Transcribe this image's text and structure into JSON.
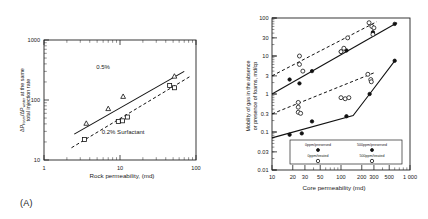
{
  "figure": {
    "panel_a_caption": "(A)",
    "panel_b_caption": "(B)"
  },
  "chart_data": [
    {
      "id": "panel_a",
      "type": "scatter",
      "title": "",
      "xlabel": "Rock permeability, (md)",
      "ylabel": "ΔP_foam/ΔP_water at the same total injection rate",
      "ylabel_line1": "ΔP",
      "ylabel_sub1": "foam",
      "ylabel_mid": "/ΔP",
      "ylabel_sub2": "water",
      "ylabel_tail": " at the same",
      "ylabel_line2": "total injection rate",
      "xscale": "log",
      "yscale": "log",
      "xlim": [
        1,
        100
      ],
      "ylim": [
        10,
        1000
      ],
      "xticks": [
        "1",
        "10",
        "100"
      ],
      "yticks": [
        "10",
        "100",
        "1000"
      ],
      "grid": false,
      "annotations": [
        {
          "text": "0.5%",
          "x": 6.0,
          "y": 330
        },
        {
          "text": "0.2% Surfactant",
          "x": 11.0,
          "y": 27
        }
      ],
      "series": [
        {
          "name": "0.5%",
          "marker": "triangle-open",
          "line": "solid",
          "points": [
            {
              "x": 3.6,
              "y": 41
            },
            {
              "x": 7.0,
              "y": 72
            },
            {
              "x": 11.0,
              "y": 115
            },
            {
              "x": 52.0,
              "y": 250
            }
          ],
          "fit_line": [
            {
              "x": 2.5,
              "y": 27
            },
            {
              "x": 70.0,
              "y": 300
            }
          ]
        },
        {
          "name": "0.2% Surfactant",
          "marker": "square-open",
          "line": "dashed",
          "points": [
            {
              "x": 3.4,
              "y": 22
            },
            {
              "x": 9.5,
              "y": 44
            },
            {
              "x": 12.5,
              "y": 52
            },
            {
              "x": 10.8,
              "y": 45
            },
            {
              "x": 45.0,
              "y": 175
            },
            {
              "x": 52.0,
              "y": 160
            }
          ],
          "fit_line": [
            {
              "x": 2.3,
              "y": 16
            },
            {
              "x": 85.0,
              "y": 250
            }
          ]
        }
      ]
    },
    {
      "id": "panel_b",
      "type": "scatter",
      "title": "",
      "xlabel": "Core permeability (md)",
      "ylabel": "Mobility of gas in the absence or presence of foams, md/cp",
      "ylabel_line1": "Mobility of gas in the absence",
      "ylabel_line2": "or presence of foams, md/cp",
      "xscale": "log",
      "yscale": "log",
      "xlim": [
        10,
        1000
      ],
      "ylim": [
        0.01,
        100
      ],
      "xticks": [
        "10",
        "20",
        "30",
        "50",
        "100",
        "200",
        "300",
        "500",
        "1 000"
      ],
      "yticks": [
        "100",
        "30",
        "10",
        "3",
        "1",
        "0.3",
        "0.1",
        "0.03",
        "0.01"
      ],
      "grid": false,
      "legend": {
        "position": "bottom-left-inside",
        "entries": [
          {
            "label": "0ppm/preserved",
            "marker": "circle-filled"
          },
          {
            "label": "500ppm/preserved",
            "marker": "circle-filled"
          },
          {
            "label": "0ppm/treated",
            "marker": "circle-open"
          },
          {
            "label": "500ppm/treated",
            "marker": "circle-open"
          }
        ]
      },
      "series": [
        {
          "name": "0ppm/preserved",
          "marker": "circle-filled",
          "line": "solid",
          "points": [
            {
              "x": 18,
              "y": 2.4
            },
            {
              "x": 25,
              "y": 1.9
            },
            {
              "x": 38,
              "y": 4.0
            },
            {
              "x": 100,
              "y": 13.0
            },
            {
              "x": 120,
              "y": 14.0
            },
            {
              "x": 290,
              "y": 42.0
            },
            {
              "x": 600,
              "y": 70.0
            }
          ],
          "fit_line": [
            {
              "x": 10,
              "y": 1.0
            },
            {
              "x": 650,
              "y": 75
            }
          ]
        },
        {
          "name": "0ppm/treated",
          "marker": "circle-open",
          "line": "dashed",
          "points": [
            {
              "x": 25,
              "y": 10.0
            },
            {
              "x": 25,
              "y": 6.0
            },
            {
              "x": 28,
              "y": 4.0
            },
            {
              "x": 100,
              "y": 13.0
            },
            {
              "x": 110,
              "y": 16.0
            },
            {
              "x": 125,
              "y": 30.0
            },
            {
              "x": 255,
              "y": 75.0
            },
            {
              "x": 280,
              "y": 60.0
            },
            {
              "x": 300,
              "y": 55.0
            },
            {
              "x": 290,
              "y": 37.0
            }
          ],
          "fit_line": [
            {
              "x": 10,
              "y": 3.0
            },
            {
              "x": 330,
              "y": 80
            }
          ]
        },
        {
          "name": "500ppm/preserved",
          "marker": "circle-filled",
          "line": "solid",
          "points": [
            {
              "x": 18,
              "y": 0.085
            },
            {
              "x": 27,
              "y": 0.092
            },
            {
              "x": 38,
              "y": 0.19
            },
            {
              "x": 120,
              "y": 0.26
            },
            {
              "x": 260,
              "y": 1.0
            },
            {
              "x": 600,
              "y": 7.5
            }
          ],
          "fit_line": [
            {
              "x": 10,
              "y": 0.07
            },
            {
              "x": 150,
              "y": 0.27
            },
            {
              "x": 260,
              "y": 1.0
            },
            {
              "x": 620,
              "y": 8.0
            }
          ]
        },
        {
          "name": "500ppm/treated",
          "marker": "circle-open",
          "line": "dashed",
          "points": [
            {
              "x": 24,
              "y": 0.6
            },
            {
              "x": 24,
              "y": 0.45
            },
            {
              "x": 24,
              "y": 0.33
            },
            {
              "x": 26,
              "y": 0.31
            },
            {
              "x": 100,
              "y": 0.8
            },
            {
              "x": 115,
              "y": 0.75
            },
            {
              "x": 130,
              "y": 0.8
            },
            {
              "x": 245,
              "y": 3.3
            },
            {
              "x": 270,
              "y": 2.4
            },
            {
              "x": 275,
              "y": 2.1
            }
          ],
          "fit_line": [
            {
              "x": 10,
              "y": 0.3
            },
            {
              "x": 300,
              "y": 3.6
            }
          ]
        }
      ]
    }
  ]
}
